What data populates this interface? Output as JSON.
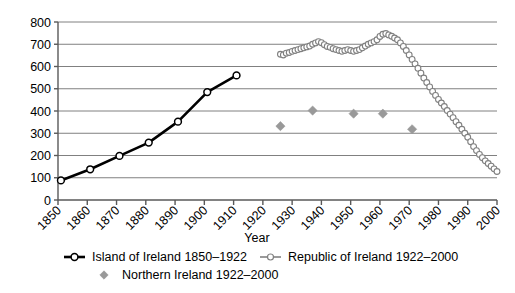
{
  "chart_data": {
    "type": "line",
    "title": "",
    "xlabel": "Year",
    "ylabel": "",
    "xlim": [
      1850,
      2000
    ],
    "ylim": [
      0,
      800
    ],
    "grid": true,
    "legend_position": "bottom",
    "x_ticks": [
      "1850",
      "1860",
      "1870",
      "1880",
      "1890",
      "1900",
      "1910",
      "1920",
      "1930",
      "1940",
      "1950",
      "1960",
      "1970",
      "1980",
      "1990",
      "2000"
    ],
    "y_ticks": [
      "0",
      "100",
      "200",
      "300",
      "400",
      "500",
      "600",
      "700",
      "800"
    ],
    "series": [
      {
        "name": "Island of Ireland 1850–1922",
        "style": "line-markers",
        "color": "#000000",
        "marker": "open-circle",
        "x": [
          1851,
          1861,
          1871,
          1881,
          1891,
          1901,
          1911
        ],
        "values": [
          88,
          138,
          198,
          258,
          352,
          485,
          560
        ]
      },
      {
        "name": "Republic of Ireland 1922–2000",
        "style": "line-markers",
        "color": "#808080",
        "marker": "open-circle",
        "x": [
          1926,
          1927,
          1928,
          1929,
          1930,
          1931,
          1932,
          1933,
          1934,
          1935,
          1936,
          1937,
          1938,
          1939,
          1940,
          1941,
          1942,
          1943,
          1944,
          1945,
          1946,
          1947,
          1948,
          1949,
          1950,
          1951,
          1952,
          1953,
          1954,
          1955,
          1956,
          1957,
          1958,
          1959,
          1960,
          1961,
          1962,
          1963,
          1964,
          1965,
          1966,
          1967,
          1968,
          1969,
          1970,
          1971,
          1972,
          1973,
          1974,
          1975,
          1976,
          1977,
          1978,
          1979,
          1980,
          1981,
          1982,
          1983,
          1984,
          1985,
          1986,
          1987,
          1988,
          1989,
          1990,
          1991,
          1992,
          1993,
          1994,
          1995,
          1996,
          1997,
          1998,
          1999,
          2000
        ],
        "values": [
          655,
          652,
          660,
          663,
          668,
          672,
          676,
          680,
          684,
          688,
          692,
          700,
          706,
          712,
          707,
          698,
          690,
          686,
          680,
          676,
          672,
          668,
          672,
          676,
          672,
          668,
          672,
          676,
          684,
          692,
          700,
          706,
          712,
          720,
          735,
          745,
          748,
          742,
          736,
          728,
          720,
          706,
          690,
          672,
          652,
          632,
          612,
          592,
          570,
          548,
          528,
          508,
          488,
          470,
          452,
          436,
          420,
          402,
          386,
          370,
          352,
          336,
          318,
          300,
          282,
          262,
          240,
          222,
          205,
          190,
          176,
          164,
          152,
          140,
          128
        ]
      },
      {
        "name": "Northern Ireland 1922–2000",
        "style": "markers",
        "color": "#999999",
        "marker": "diamond",
        "x": [
          1926,
          1937,
          1951,
          1961,
          1971
        ],
        "values": [
          332,
          402,
          388,
          388,
          318
        ]
      }
    ]
  },
  "legend": {
    "items": [
      {
        "label": "Island of Ireland 1850–1922",
        "marker": "line-open-circle-black",
        "color": "#000000"
      },
      {
        "label": "Republic of Ireland 1922–2000",
        "marker": "line-open-circle-gray",
        "color": "#808080"
      },
      {
        "label": "Northern Ireland 1922–2000",
        "marker": "diamond-gray",
        "color": "#999999"
      }
    ]
  }
}
